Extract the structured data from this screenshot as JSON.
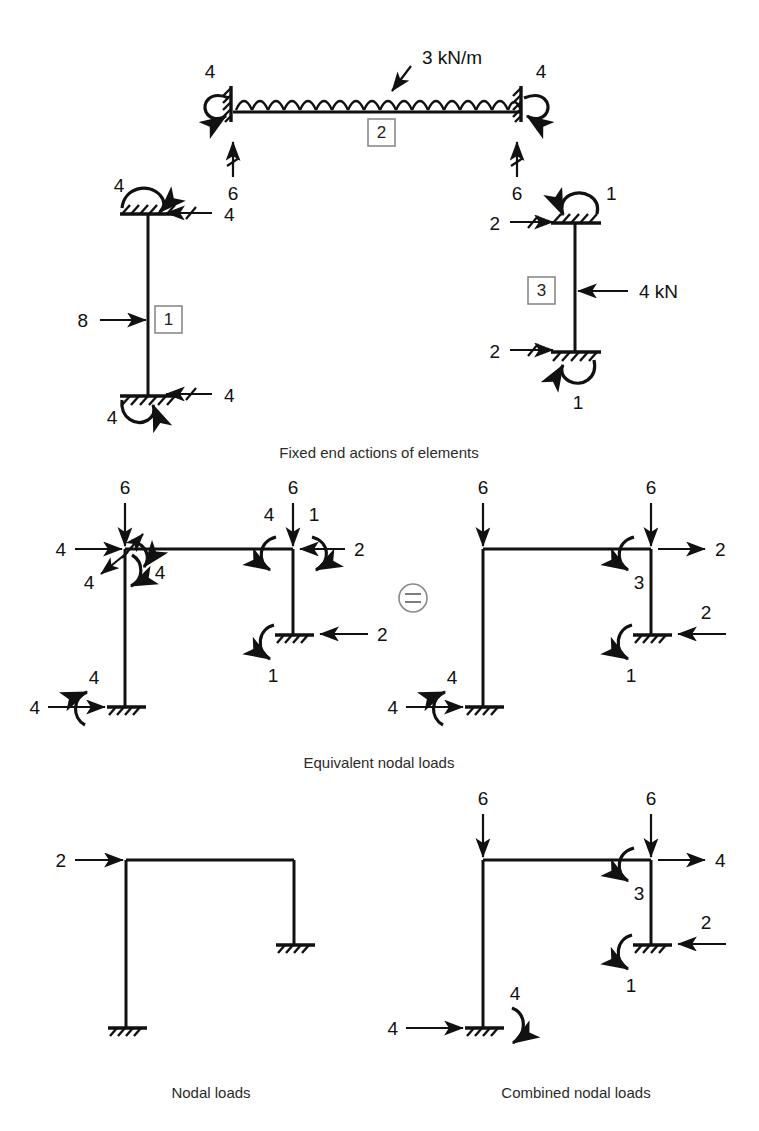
{
  "figure": {
    "captions": {
      "fixed_end_actions": "Fixed end actions of elements",
      "equivalent_nodal_loads": "Equivalent nodal loads",
      "nodal_loads": "Nodal loads",
      "combined_nodal_loads": "Combined nodal loads"
    },
    "equals_symbol": "="
  },
  "fixed_end_actions": {
    "beam": {
      "element_label": "2",
      "udl_label": "3 kN/m",
      "left_end_moment": "4",
      "right_end_moment": "4",
      "left_reaction": "6",
      "right_reaction": "6"
    },
    "left_column": {
      "element_label": "1",
      "point_load": "8",
      "top_moment": "4",
      "top_shear": "4",
      "bottom_moment": "4",
      "bottom_shear": "4"
    },
    "right_column": {
      "element_label": "3",
      "point_load": "4 kN",
      "top_moment": "1",
      "top_shear": "2",
      "bottom_moment": "1",
      "bottom_shear": "2"
    }
  },
  "equivalent_nodal_loads": {
    "left_frame": {
      "top_left_vertical": "6",
      "top_left_horizontal": "4",
      "top_left_moment_up": "4",
      "top_left_moment_down": "4",
      "top_left_shear_back": "4",
      "top_right_vertical": "6",
      "top_right_moment_left": "4",
      "top_right_moment_right": "1",
      "top_right_horizontal": "2",
      "base_right_horizontal": "2",
      "base_right_moment": "1",
      "base_left_horizontal": "4",
      "base_left_moment": "4"
    },
    "right_frame": {
      "top_left_vertical": "6",
      "top_right_vertical": "6",
      "top_right_horizontal": "2",
      "top_right_moment": "3",
      "base_right_horizontal": "2",
      "base_right_moment": "1",
      "base_left_horizontal": "4",
      "base_left_moment": "4"
    }
  },
  "nodal_loads": {
    "top_left_horizontal": "2"
  },
  "combined_nodal_loads": {
    "top_left_vertical": "6",
    "top_right_vertical": "6",
    "top_right_horizontal": "4",
    "top_right_moment": "3",
    "base_right_horizontal": "2",
    "base_right_moment": "1",
    "base_left_horizontal": "4",
    "base_left_moment": "4"
  },
  "colors": {
    "ink": "#111111",
    "caption": "#2b2b2b",
    "box_outline": "#8a8a8a",
    "background": "#ffffff"
  }
}
